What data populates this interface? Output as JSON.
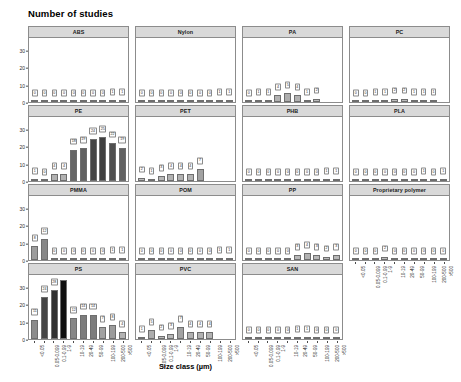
{
  "figure": {
    "title": "Number of studies",
    "xlabel": "Size class (µm)"
  },
  "chart_data": {
    "type": "bar",
    "title": "Number of studies",
    "xlabel": "Size class (µm)",
    "ylabel": "Number of studies",
    "ylim": [
      0,
      36
    ],
    "yticks": [
      0,
      10,
      20,
      30
    ],
    "grid": false,
    "legend": "none",
    "facet_layout": {
      "rows": 4,
      "cols": 4,
      "scales": "fixed"
    },
    "colormap": "grey gradient, darker = higher count",
    "categories": [
      "<0.05",
      "0.05-0.099",
      "0.1-0.99",
      "1-9",
      "10-19",
      "20-49",
      "50-99",
      "100-199",
      "200-500",
      ">500"
    ],
    "panels": [
      {
        "name": "ABS",
        "values": [
          0,
          0,
          0,
          0,
          0,
          0,
          0,
          0,
          1,
          1
        ]
      },
      {
        "name": "Nylon",
        "values": [
          0,
          0,
          0,
          0,
          0,
          0,
          0,
          0,
          1,
          1
        ]
      },
      {
        "name": "PA",
        "values": [
          0,
          1,
          1,
          4,
          5,
          4,
          1,
          2
        ]
      },
      {
        "name": "PC",
        "values": [
          0,
          0,
          1,
          1,
          2,
          2,
          1,
          1,
          1
        ]
      },
      {
        "name": "PE",
        "values": [
          1,
          0,
          4,
          4,
          18,
          19,
          24,
          25,
          22,
          19,
          13
        ]
      },
      {
        "name": "PET",
        "values": [
          2,
          1,
          3,
          4,
          4,
          4,
          7
        ]
      },
      {
        "name": "PHB",
        "values": [
          0,
          0,
          0,
          0,
          0,
          0,
          0,
          0,
          1,
          1
        ]
      },
      {
        "name": "PLA",
        "values": [
          0,
          0,
          0,
          0,
          0,
          0,
          0,
          1,
          0,
          1
        ]
      },
      {
        "name": "PMMA",
        "values": [
          8,
          12,
          0,
          0,
          0,
          0,
          0,
          0,
          1,
          1
        ]
      },
      {
        "name": "POM",
        "values": [
          0,
          0,
          0,
          0,
          0,
          0,
          0,
          0,
          1,
          1
        ]
      },
      {
        "name": "PP",
        "values": [
          0,
          0,
          0,
          0,
          0,
          3,
          4,
          3,
          2,
          3
        ]
      },
      {
        "name": "Proprietary polymer",
        "values": [
          0,
          0,
          0,
          2,
          0,
          0,
          0,
          0,
          0,
          0
        ]
      },
      {
        "name": "PS",
        "values": [
          11,
          24,
          28,
          34,
          12,
          14,
          14,
          7,
          8,
          4
        ]
      },
      {
        "name": "PVC",
        "values": [
          1,
          5,
          2,
          3,
          7,
          4,
          4,
          4
        ]
      },
      {
        "name": "SAN",
        "values": [
          0,
          0,
          0,
          0,
          0,
          1,
          1,
          0,
          0,
          0
        ]
      }
    ]
  }
}
